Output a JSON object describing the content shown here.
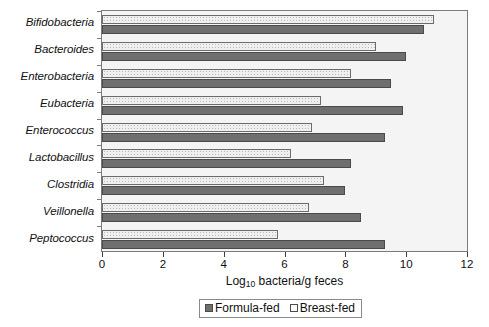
{
  "chart_data": {
    "type": "bar",
    "orientation": "horizontal",
    "title": "",
    "xlabel": "Log10 bacteria/g feces",
    "xlabel_base": "Log",
    "xlabel_sub": "10",
    "xlabel_rest": " bacteria/g feces",
    "ylabel": "",
    "xlim": [
      0,
      12
    ],
    "xticks": [
      0,
      2,
      4,
      6,
      8,
      10,
      12
    ],
    "xtick_labels": [
      "0",
      "2",
      "4",
      "6",
      "8",
      "10",
      "12"
    ],
    "grid": false,
    "legend_position": "bottom-center",
    "categories": [
      "Bifidobacteria",
      "Bacteroides",
      "Enterobacteria",
      "Eubacteria",
      "Enterococcus",
      "Lactobacillus",
      "Clostridia",
      "Veillonella",
      "Peptococcus"
    ],
    "series": [
      {
        "name": "Breast-fed",
        "color": "#efefef",
        "pattern": "dotted",
        "values": [
          10.9,
          9.0,
          8.2,
          7.2,
          6.9,
          6.2,
          7.3,
          6.8,
          5.8
        ]
      },
      {
        "name": "Formula-fed",
        "color": "#6f6f6f",
        "pattern": "solid",
        "values": [
          10.6,
          10.0,
          9.5,
          9.9,
          9.3,
          8.2,
          8.0,
          8.5,
          9.3
        ]
      }
    ]
  },
  "legend": {
    "entries": [
      {
        "label": "Formula-fed",
        "swatch": "solid-dark"
      },
      {
        "label": "Breast-fed",
        "swatch": "open-light"
      }
    ]
  }
}
